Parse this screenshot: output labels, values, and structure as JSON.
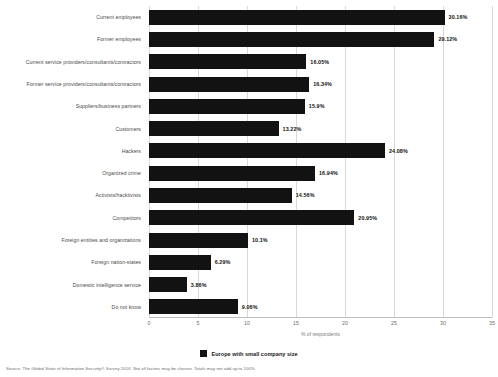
{
  "chart_data": {
    "type": "bar",
    "orientation": "horizontal",
    "title": "",
    "xlabel": "% of respondents",
    "ylabel": "",
    "xlim": [
      0,
      35
    ],
    "xticks": [
      0,
      5,
      10,
      15,
      20,
      25,
      30,
      35
    ],
    "grid": true,
    "legend_position": "bottom",
    "series": [
      {
        "name": "Europe with small company size",
        "color": "#121212",
        "values": [
          30.16,
          29.12,
          16.05,
          16.34,
          15.9,
          13.22,
          24.08,
          16.94,
          14.56,
          20.95,
          10.1,
          6.29,
          3.86,
          9.06
        ]
      }
    ],
    "categories": [
      "Current employees",
      "Former employees",
      "Current service providers/consultants/contractors",
      "Former service providers/consultants/contractors",
      "Suppliers/business partners",
      "Customers",
      "Hackers",
      "Organized crime",
      "Activists/hacktivists",
      "Competitors",
      "Foreign entities and organizations",
      "Foreign nation-states",
      "Domestic intelligence service",
      "Do not know"
    ],
    "data_labels": [
      "30.16%",
      "29.12%",
      "16.05%",
      "16.34%",
      "15.9%",
      "13.22%",
      "24.08%",
      "16.94%",
      "14.56%",
      "20.95%",
      "10.1%",
      "6.29%",
      "3.86%",
      "9.06%"
    ],
    "tick_labels": [
      "0",
      "5",
      "10",
      "15",
      "20",
      "25",
      "30",
      "35"
    ]
  },
  "legend": {
    "label": "Europe with small company size"
  },
  "footer": {
    "source": "Source: The Global State of Information Security® Survey 2016. Not all factors may be chosen. Totals may not add up to 100%."
  }
}
